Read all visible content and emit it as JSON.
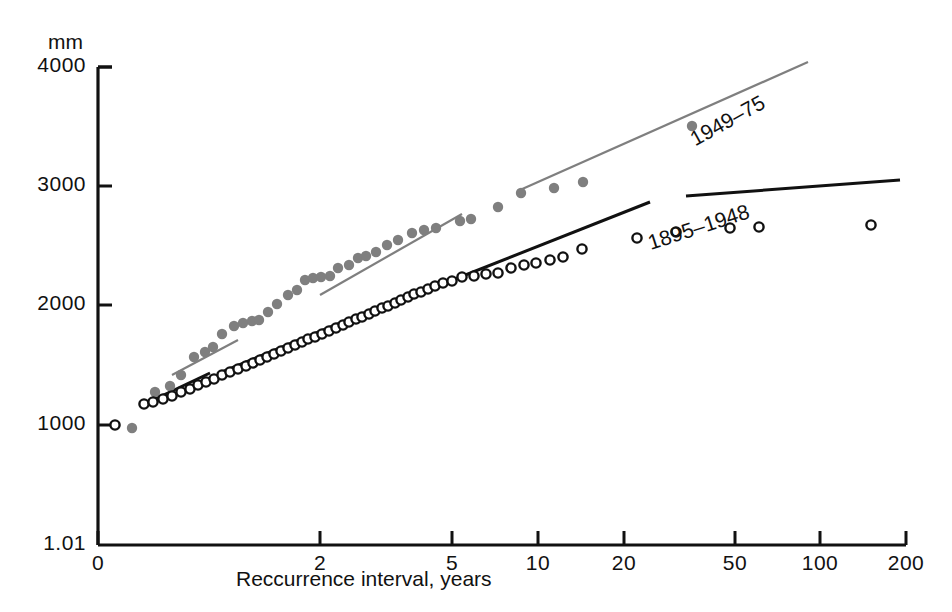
{
  "chart_data": {
    "type": "scatter",
    "title": "",
    "xlabel": "Reccurrence interval, years",
    "ylabel": "mm",
    "xscale": "log",
    "yscale": "linear",
    "xlim": [
      1.01,
      200
    ],
    "ylim": [
      1.01,
      4000
    ],
    "grid": false,
    "legend_position": "inline-along-trendlines",
    "xticks": [
      {
        "value": 1.01,
        "label": "0",
        "px": 98
      },
      {
        "value": 2,
        "label": "2",
        "px": 320
      },
      {
        "value": 5,
        "label": "5",
        "px": 452
      },
      {
        "value": 10,
        "label": "10",
        "px": 538
      },
      {
        "value": 20,
        "label": "20",
        "px": 624
      },
      {
        "value": 50,
        "label": "50",
        "px": 735
      },
      {
        "value": 100,
        "label": "100",
        "px": 820
      },
      {
        "value": 200,
        "label": "200",
        "px": 906
      }
    ],
    "yticks": [
      {
        "value": 4000,
        "label": "4000",
        "px": 67
      },
      {
        "value": 3000,
        "label": "3000",
        "px": 186
      },
      {
        "value": 2000,
        "label": "2000",
        "px": 305
      },
      {
        "value": 1000,
        "label": "1000",
        "px": 425
      },
      {
        "value": 1.01,
        "label": "1.01",
        "px": 545
      }
    ],
    "series": [
      {
        "name": "1949-75",
        "marker": "filled-circle",
        "color": "#7f7f7f",
        "label_text": "1949–75",
        "points_px": [
          [
            132,
            428
          ],
          [
            155,
            392
          ],
          [
            170,
            386
          ],
          [
            181,
            375
          ],
          [
            194,
            357
          ],
          [
            205,
            352
          ],
          [
            213,
            347
          ],
          [
            222,
            334
          ],
          [
            234,
            326
          ],
          [
            243,
            323
          ],
          [
            252,
            321
          ],
          [
            259,
            320
          ],
          [
            268,
            312
          ],
          [
            277,
            304
          ],
          [
            288,
            295
          ],
          [
            297,
            290
          ],
          [
            305,
            280
          ],
          [
            313,
            278
          ],
          [
            321,
            277
          ],
          [
            330,
            276
          ],
          [
            338,
            268
          ],
          [
            349,
            265
          ],
          [
            358,
            258
          ],
          [
            366,
            256
          ],
          [
            376,
            252
          ],
          [
            387,
            245
          ],
          [
            398,
            240
          ],
          [
            412,
            233
          ],
          [
            424,
            230
          ],
          [
            436,
            228
          ],
          [
            460,
            221
          ],
          [
            471,
            219
          ],
          [
            498,
            207
          ],
          [
            521,
            193
          ],
          [
            554,
            188
          ],
          [
            583,
            182
          ],
          [
            692,
            126
          ]
        ],
        "trend_segments_px": [
          [
            [
              172,
              375
            ],
            [
              238,
              340
            ]
          ],
          [
            [
              320,
              295
            ],
            [
              462,
              214
            ]
          ],
          [
            [
              520,
              190
            ],
            [
              808,
              62
            ]
          ]
        ]
      },
      {
        "name": "1895-1948",
        "marker": "open-circle",
        "color": "#111111",
        "label_text": "1895–1948",
        "points_px": [
          [
            115,
            425
          ],
          [
            144,
            404
          ],
          [
            153,
            402
          ],
          [
            163,
            399
          ],
          [
            172,
            396
          ],
          [
            181,
            392
          ],
          [
            190,
            389
          ],
          [
            198,
            385
          ],
          [
            206,
            382
          ],
          [
            214,
            379
          ],
          [
            222,
            375
          ],
          [
            230,
            372
          ],
          [
            238,
            369
          ],
          [
            246,
            366
          ],
          [
            253,
            363
          ],
          [
            260,
            360
          ],
          [
            267,
            357
          ],
          [
            274,
            354
          ],
          [
            281,
            351
          ],
          [
            288,
            348
          ],
          [
            295,
            345
          ],
          [
            302,
            342
          ],
          [
            308,
            339
          ],
          [
            315,
            337
          ],
          [
            322,
            334
          ],
          [
            329,
            331
          ],
          [
            336,
            328
          ],
          [
            343,
            325
          ],
          [
            349,
            322
          ],
          [
            356,
            319
          ],
          [
            362,
            317
          ],
          [
            369,
            314
          ],
          [
            375,
            311
          ],
          [
            382,
            308
          ],
          [
            388,
            306
          ],
          [
            395,
            303
          ],
          [
            401,
            300
          ],
          [
            408,
            297
          ],
          [
            414,
            294
          ],
          [
            421,
            292
          ],
          [
            428,
            289
          ],
          [
            435,
            286
          ],
          [
            443,
            283
          ],
          [
            452,
            281
          ],
          [
            462,
            277
          ],
          [
            474,
            276
          ],
          [
            486,
            274
          ],
          [
            498,
            273
          ],
          [
            511,
            268
          ],
          [
            524,
            265
          ],
          [
            536,
            263
          ],
          [
            550,
            260
          ],
          [
            563,
            257
          ],
          [
            582,
            249
          ],
          [
            637,
            238
          ],
          [
            676,
            232
          ],
          [
            730,
            228
          ],
          [
            759,
            227
          ],
          [
            871,
            225
          ]
        ],
        "trend_segments_px": [
          [
            [
              153,
              400
            ],
            [
              210,
              373
            ]
          ],
          [
            [
              222,
              372
            ],
            [
              420,
              290
            ]
          ],
          [
            [
              440,
              285
            ],
            [
              650,
              202
            ]
          ],
          [
            [
              686,
              196
            ],
            [
              900,
              180
            ]
          ]
        ]
      }
    ]
  },
  "axes": {
    "y_unit_label": "mm",
    "x_axis_title": "Reccurrence interval, years"
  },
  "colors": {
    "series_1949_75": "#7f7f7f",
    "series_1895_1948": "#111111",
    "axis": "#111111",
    "background": "#ffffff"
  }
}
